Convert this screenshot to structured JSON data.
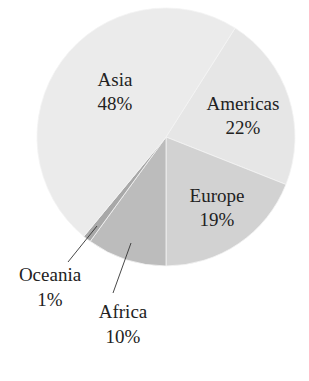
{
  "chart_data": {
    "type": "pie",
    "title": "",
    "categories": [
      "Asia",
      "Americas",
      "Europe",
      "Africa",
      "Oceania"
    ],
    "values": [
      48,
      22,
      19,
      10,
      1
    ],
    "unit": "%",
    "labels": [
      "Asia 48%",
      "Americas 22%",
      "Europe 19%",
      "Africa 10%",
      "Oceania 1%"
    ],
    "start_angle_deg_clockwise_from_top": 32.4,
    "slice_order_clockwise": [
      "Americas",
      "Europe",
      "Africa",
      "Oceania",
      "Asia"
    ],
    "colors": {
      "Asia": "#ebebeb",
      "Americas": "#e6e6e6",
      "Europe": "#d2d2d2",
      "Africa": "#bcbcbc",
      "Oceania": "#a8a8a8"
    },
    "legend": "none (direct labels)",
    "leader_lines": [
      "Oceania",
      "Africa"
    ]
  },
  "labels": {
    "asia": {
      "name": "Asia",
      "pct": "48%"
    },
    "americas": {
      "name": "Americas",
      "pct": "22%"
    },
    "europe": {
      "name": "Europe",
      "pct": "19%"
    },
    "africa": {
      "name": "Africa",
      "pct": "10%"
    },
    "oceania": {
      "name": "Oceania",
      "pct": "1%"
    }
  }
}
